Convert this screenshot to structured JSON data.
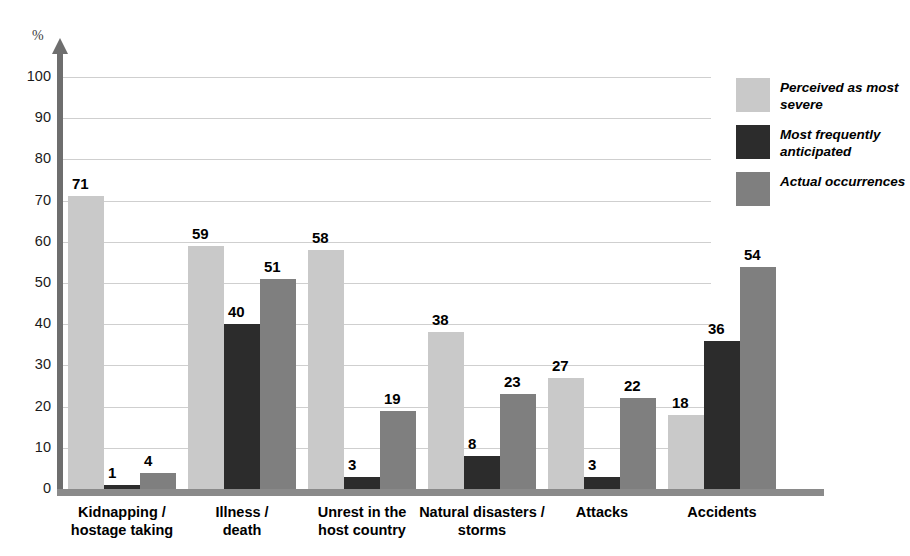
{
  "chart_data": {
    "type": "bar",
    "title": "",
    "xlabel": "",
    "ylabel": "%",
    "ylim": [
      0,
      100
    ],
    "ytick_step": 10,
    "yticks": [
      "100",
      "90",
      "80",
      "70",
      "60",
      "50",
      "40",
      "30",
      "20",
      "10",
      "0"
    ],
    "grid": true,
    "legend_position": "right",
    "categories": [
      "Kidnapping /\nhostage taking",
      "Illness /\ndeath",
      "Unrest in the\nhost country",
      "Natural disasters /\nstorms",
      "Attacks",
      "Accidents"
    ],
    "category_lines": [
      [
        "Kidnapping /",
        "hostage taking"
      ],
      [
        "Illness /",
        "death"
      ],
      [
        "Unrest in the",
        "host country"
      ],
      [
        "Natural disasters /",
        "storms"
      ],
      [
        "Attacks",
        ""
      ],
      [
        "Accidents",
        ""
      ]
    ],
    "series": [
      {
        "name": "Perceived as most severe",
        "name_lines": [
          "Perceived as most",
          "severe"
        ],
        "color": "#c9c9c9",
        "values": [
          71,
          59,
          58,
          38,
          27,
          18
        ]
      },
      {
        "name": "Most frequently anticipated",
        "name_lines": [
          "Most frequently",
          "anticipated"
        ],
        "color": "#2c2c2c",
        "values": [
          1,
          40,
          3,
          8,
          3,
          36
        ]
      },
      {
        "name": "Actual occurrences",
        "name_lines": [
          "Actual occurrences",
          ""
        ],
        "color": "#7f7f7f",
        "values": [
          4,
          51,
          19,
          23,
          22,
          54
        ]
      }
    ]
  },
  "axis": {
    "y_title": "%"
  },
  "colors": {
    "perceived": "#c9c9c9",
    "anticipated": "#2c2c2c",
    "actual": "#7f7f7f",
    "gridline": "#cfcfcf",
    "axis": "#6e6e6e",
    "baseline": "#8a8a8a"
  }
}
